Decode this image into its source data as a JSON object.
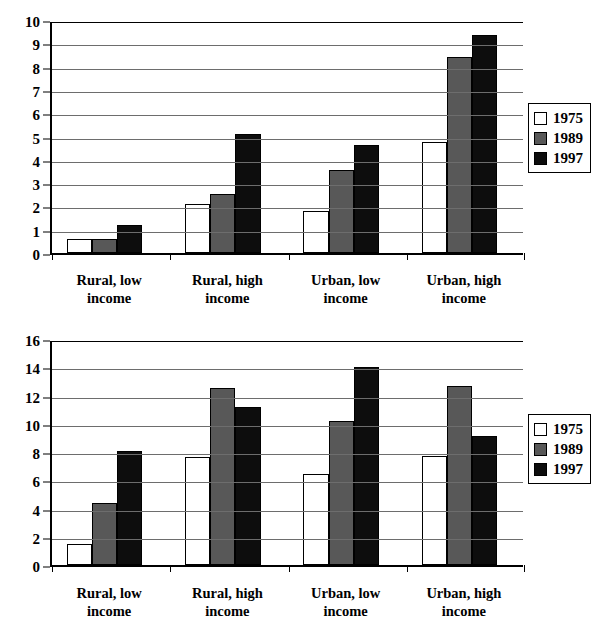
{
  "chart_data": [
    {
      "id": "top",
      "type": "bar",
      "title": "",
      "xlabel": "",
      "ylabel": "",
      "ylim": [
        0,
        10
      ],
      "ytick_step": 1,
      "yticks": [
        0,
        1,
        2,
        3,
        4,
        5,
        6,
        7,
        8,
        9,
        10
      ],
      "grid": true,
      "legend_position": "right",
      "categories": [
        "Rural, low\nincome",
        "Rural, high\nincome",
        "Urban, low\nincome",
        "Urban, high\nincome"
      ],
      "series": [
        {
          "name": "1975",
          "color": "#ffffff",
          "values": [
            0.6,
            2.1,
            1.8,
            4.75
          ]
        },
        {
          "name": "1989",
          "color": "#585858",
          "values": [
            0.6,
            2.55,
            3.55,
            8.4
          ]
        },
        {
          "name": "1997",
          "color": "#0d0d0d",
          "values": [
            1.2,
            5.1,
            4.65,
            9.35
          ]
        }
      ]
    },
    {
      "id": "bottom",
      "type": "bar",
      "title": "",
      "xlabel": "",
      "ylabel": "",
      "ylim": [
        0,
        16
      ],
      "ytick_step": 2,
      "yticks": [
        0,
        2,
        4,
        6,
        8,
        10,
        12,
        14,
        16
      ],
      "grid": true,
      "legend_position": "right",
      "categories": [
        "Rural, low\nincome",
        "Rural, high\nincome",
        "Urban, low\nincome",
        "Urban, high\nincome"
      ],
      "series": [
        {
          "name": "1975",
          "color": "#ffffff",
          "values": [
            1.5,
            7.65,
            6.45,
            7.7
          ]
        },
        {
          "name": "1989",
          "color": "#585858",
          "values": [
            4.4,
            12.5,
            10.2,
            12.7
          ]
        },
        {
          "name": "1997",
          "color": "#0d0d0d",
          "values": [
            8.1,
            11.2,
            14.05,
            9.1
          ]
        }
      ]
    }
  ],
  "legend": {
    "entries": [
      {
        "label": "1975",
        "swatch": "white-swatch"
      },
      {
        "label": "1989",
        "swatch": "gray-swatch"
      },
      {
        "label": "1997",
        "swatch": "black-swatch"
      }
    ]
  },
  "colors": {
    "series_1975": "#ffffff",
    "series_1989": "#585858",
    "series_1997": "#0d0d0d",
    "axis": "#000000",
    "gridline": "#6d6d6d",
    "background": "#ffffff"
  }
}
